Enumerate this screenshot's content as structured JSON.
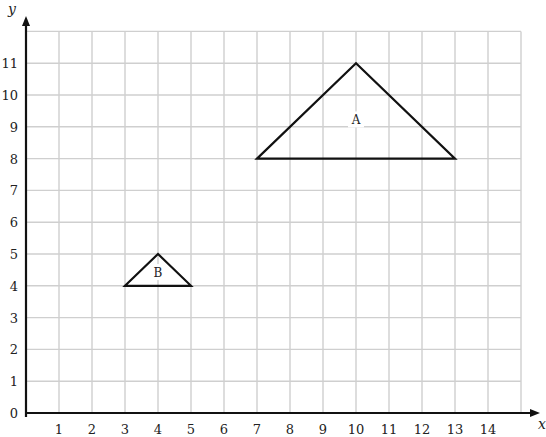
{
  "chart_data": {
    "type": "scatter",
    "title": "",
    "xlabel": "x",
    "ylabel": "y",
    "xlim": [
      0,
      15
    ],
    "ylim": [
      0,
      12
    ],
    "grid": true,
    "x_ticks": [
      "1",
      "2",
      "3",
      "4",
      "5",
      "6",
      "7",
      "8",
      "9",
      "10",
      "11",
      "12",
      "13",
      "14"
    ],
    "y_ticks": [
      "0",
      "1",
      "2",
      "3",
      "4",
      "5",
      "6",
      "7",
      "8",
      "9",
      "10",
      "11"
    ],
    "shapes": [
      {
        "name": "A",
        "type": "triangle",
        "vertices": [
          [
            7,
            8
          ],
          [
            10,
            11
          ],
          [
            13,
            8
          ]
        ],
        "label_pos": [
          10,
          9.2
        ]
      },
      {
        "name": "B",
        "type": "triangle",
        "vertices": [
          [
            3,
            4
          ],
          [
            4,
            5
          ],
          [
            5,
            4
          ]
        ],
        "label_pos": [
          4,
          4.4
        ]
      }
    ]
  },
  "colors": {
    "grid": "#cfcfcf",
    "axis": "#111111",
    "shape": "#111111"
  }
}
